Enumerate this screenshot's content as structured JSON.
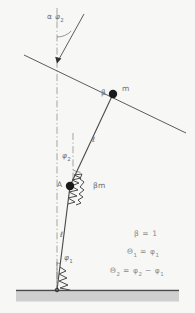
{
  "figure": {
    "background_color": "#f7f7f5",
    "line_color": "#4a4a4a",
    "text_color": "#6e6e6e",
    "ground_fill": "#cccccc"
  },
  "labels": {
    "alpha_phi2": {
      "symbol": "α",
      "variable": "φ",
      "subscript": "2"
    },
    "phi2": {
      "variable": "φ",
      "subscript": "2"
    },
    "phi1": {
      "variable": "φ",
      "subscript": "1"
    },
    "upper_rod_length": "ℓ",
    "lower_rod_length": "ℓ",
    "point_a": "A",
    "mass_upper": "m",
    "mass_upper_prefix": "β",
    "mass_lower": "βm"
  },
  "equations": [
    {
      "id": "beta-value",
      "text": "β = 1"
    },
    {
      "id": "theta1-def",
      "lhs": "Θ",
      "lhs_sub": "1",
      "mid": " = ",
      "rhs": "φ",
      "rhs_sub": "1"
    },
    {
      "id": "theta2-def",
      "lhs": "Θ",
      "lhs_sub": "2",
      "mid": " = ",
      "rhs": "φ",
      "rhs_sub": "2",
      "tail": " − ",
      "tail2": "φ",
      "tail2_sub": "1"
    }
  ],
  "elements": {
    "ground_label": "hatched-ground",
    "base_pivot": "base-pivot",
    "inclined_surface": "inclined-constraint-line",
    "vertical_reference": "vertical-dash-dot-axis",
    "spring_lower": "lower-torsion-spring",
    "spring_upper": "upper-torsion-spring",
    "arrow": "constraint-arrow"
  }
}
